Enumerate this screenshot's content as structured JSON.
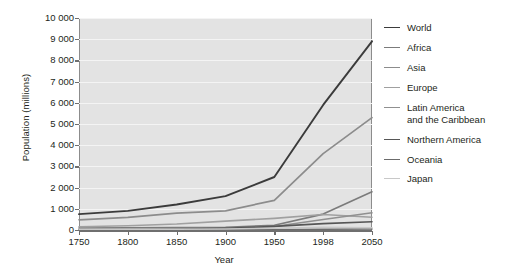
{
  "chart_data": {
    "type": "line",
    "title": "",
    "xlabel": "Year",
    "ylabel": "Population (millions)",
    "x": [
      1750,
      1800,
      1850,
      1900,
      1950,
      1998,
      2050
    ],
    "xtick_labels": [
      "1750",
      "1800",
      "1850",
      "1900",
      "1950",
      "1998",
      "2050"
    ],
    "ytick_labels": [
      "0",
      "1 000",
      "2 000",
      "3 000",
      "4 000",
      "5 000",
      "6 000",
      "7 000",
      "8 000",
      "9 000",
      "10 000"
    ],
    "ytick_values": [
      0,
      1000,
      2000,
      3000,
      4000,
      5000,
      6000,
      7000,
      8000,
      9000,
      10000
    ],
    "ylim": [
      0,
      10000
    ],
    "grid": true,
    "legend_position": "right",
    "series": [
      {
        "name": "World",
        "color": "#3b3b3b",
        "width": 1.9,
        "values": [
          750,
          900,
          1200,
          1600,
          2500,
          5900,
          8900
        ]
      },
      {
        "name": "Africa",
        "color": "#7b7b7b",
        "width": 1.6,
        "values": [
          90,
          100,
          110,
          130,
          220,
          750,
          1800
        ]
      },
      {
        "name": "Asia",
        "color": "#8c8c8c",
        "width": 1.7,
        "values": [
          480,
          600,
          800,
          900,
          1400,
          3600,
          5300
        ]
      },
      {
        "name": "Europe",
        "color": "#a0a0a0",
        "width": 1.6,
        "values": [
          150,
          200,
          280,
          420,
          550,
          730,
          600
        ]
      },
      {
        "name": "Latin America\nand the Caribbean",
        "color": "#909090",
        "width": 1.5,
        "values": [
          20,
          25,
          35,
          70,
          170,
          500,
          810
        ]
      },
      {
        "name": "Northern America",
        "color": "#565656",
        "width": 1.6,
        "values": [
          5,
          10,
          30,
          80,
          170,
          300,
          390
        ]
      },
      {
        "name": "Oceania",
        "color": "#6b6b6b",
        "width": 1.5,
        "values": [
          2,
          2,
          2,
          6,
          13,
          30,
          46
        ]
      },
      {
        "name": "Japan",
        "color": "#c8c8c8",
        "width": 1.5,
        "values": [
          30,
          30,
          32,
          44,
          84,
          126,
          110
        ]
      }
    ]
  },
  "legend": {
    "entries": [
      "World",
      "Africa",
      "Asia",
      "Europe",
      "Latin America\nand the Caribbean",
      "Northern America",
      "Oceania",
      "Japan"
    ]
  },
  "colors": {
    "plot_background": "#e3e3e3",
    "gridline": "#f4f4f4",
    "axis": "#6f6f6f",
    "text": "#231f20",
    "page_background": "#ffffff"
  }
}
